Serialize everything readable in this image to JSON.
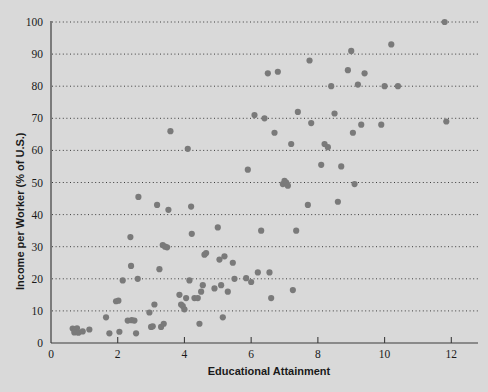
{
  "chart_data": {
    "type": "scatter",
    "title": "",
    "xlabel": "Educational Attainment",
    "ylabel": "Income per Worker (% of U.S.)",
    "xlim": [
      0,
      12.8
    ],
    "ylim": [
      0,
      100
    ],
    "xticks": [
      0,
      2,
      4,
      6,
      8,
      10,
      12
    ],
    "yticks": [
      0,
      10,
      20,
      30,
      40,
      50,
      60,
      70,
      80,
      90,
      100
    ],
    "grid": "horizontal-dotted",
    "legend": "none",
    "marker": {
      "shape": "circle",
      "color": "#7a7a7a",
      "size": 4
    },
    "background_color": "#d9d9d9",
    "axis_color": "#3c3c3c",
    "points": [
      [
        0.65,
        4.5
      ],
      [
        0.72,
        4.0
      ],
      [
        0.78,
        4.6
      ],
      [
        0.7,
        3.3
      ],
      [
        0.82,
        3.2
      ],
      [
        0.95,
        3.6
      ],
      [
        1.15,
        4.2
      ],
      [
        1.65,
        8.0
      ],
      [
        1.75,
        3.0
      ],
      [
        1.95,
        13.0
      ],
      [
        2.02,
        13.2
      ],
      [
        2.05,
        3.5
      ],
      [
        2.15,
        19.5
      ],
      [
        2.3,
        7.0
      ],
      [
        2.42,
        7.1
      ],
      [
        2.5,
        7.0
      ],
      [
        2.4,
        24.0
      ],
      [
        2.38,
        33.0
      ],
      [
        2.55,
        3.0
      ],
      [
        2.6,
        20.0
      ],
      [
        2.62,
        45.5
      ],
      [
        2.95,
        9.5
      ],
      [
        3.0,
        5.0
      ],
      [
        3.05,
        5.2
      ],
      [
        3.1,
        12.0
      ],
      [
        3.18,
        43.0
      ],
      [
        3.25,
        23.0
      ],
      [
        3.3,
        5.0
      ],
      [
        3.38,
        6.0
      ],
      [
        3.35,
        30.5
      ],
      [
        3.42,
        30.0
      ],
      [
        3.48,
        29.8
      ],
      [
        3.52,
        41.5
      ],
      [
        3.58,
        66.0
      ],
      [
        3.85,
        15.0
      ],
      [
        3.9,
        12.0
      ],
      [
        3.95,
        11.5
      ],
      [
        4.0,
        10.5
      ],
      [
        4.05,
        14.0
      ],
      [
        4.1,
        60.5
      ],
      [
        4.15,
        19.5
      ],
      [
        4.2,
        42.5
      ],
      [
        4.22,
        34.0
      ],
      [
        4.3,
        14.0
      ],
      [
        4.4,
        14.0
      ],
      [
        4.45,
        6.0
      ],
      [
        4.5,
        16.0
      ],
      [
        4.55,
        18.0
      ],
      [
        4.6,
        27.5
      ],
      [
        4.65,
        28.0
      ],
      [
        4.9,
        17.0
      ],
      [
        5.0,
        36.0
      ],
      [
        5.05,
        26.0
      ],
      [
        5.1,
        18.0
      ],
      [
        5.15,
        8.0
      ],
      [
        5.2,
        27.0
      ],
      [
        5.3,
        16.0
      ],
      [
        5.45,
        25.0
      ],
      [
        5.5,
        20.0
      ],
      [
        5.85,
        20.2
      ],
      [
        5.9,
        54.0
      ],
      [
        6.0,
        19.0
      ],
      [
        6.1,
        71.0
      ],
      [
        6.2,
        22.0
      ],
      [
        6.3,
        35.0
      ],
      [
        6.4,
        70.0
      ],
      [
        6.5,
        84.0
      ],
      [
        6.55,
        22.0
      ],
      [
        6.6,
        14.0
      ],
      [
        6.7,
        65.5
      ],
      [
        6.8,
        84.5
      ],
      [
        6.95,
        49.5
      ],
      [
        7.0,
        50.5
      ],
      [
        7.05,
        50.0
      ],
      [
        7.1,
        49.0
      ],
      [
        7.2,
        62.0
      ],
      [
        7.25,
        16.5
      ],
      [
        7.35,
        35.0
      ],
      [
        7.4,
        72.0
      ],
      [
        7.7,
        43.0
      ],
      [
        7.75,
        88.0
      ],
      [
        7.8,
        68.5
      ],
      [
        8.1,
        55.5
      ],
      [
        8.2,
        62.0
      ],
      [
        8.3,
        61.0
      ],
      [
        8.4,
        80.0
      ],
      [
        8.5,
        71.5
      ],
      [
        8.6,
        44.0
      ],
      [
        8.7,
        55.0
      ],
      [
        8.9,
        85.0
      ],
      [
        9.0,
        91.0
      ],
      [
        9.05,
        65.5
      ],
      [
        9.1,
        49.5
      ],
      [
        9.2,
        80.5
      ],
      [
        9.3,
        68.0
      ],
      [
        9.4,
        84.0
      ],
      [
        9.9,
        68.0
      ],
      [
        10.0,
        80.0
      ],
      [
        10.2,
        93.0
      ],
      [
        10.4,
        80.0
      ],
      [
        11.8,
        100.0
      ],
      [
        11.85,
        69.0
      ]
    ]
  }
}
